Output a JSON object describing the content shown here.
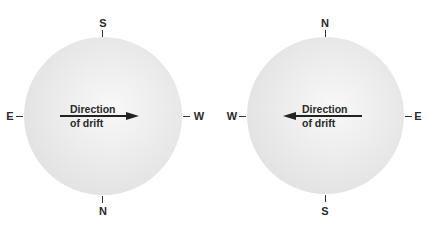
{
  "diagram": {
    "left_globe": {
      "top_label": "S",
      "bottom_label": "N",
      "left_label": "E",
      "right_label": "W",
      "arrow_direction": "right",
      "caption_line1": "Direction",
      "caption_line2": "of drift"
    },
    "right_globe": {
      "top_label": "N",
      "bottom_label": "S",
      "left_label": "W",
      "right_label": "E",
      "arrow_direction": "left",
      "caption_line1": "Direction",
      "caption_line2": "of drift"
    },
    "colors": {
      "globe_fill": "#e6e6e6",
      "ink": "#2a2a2a",
      "background": "#ffffff"
    }
  }
}
